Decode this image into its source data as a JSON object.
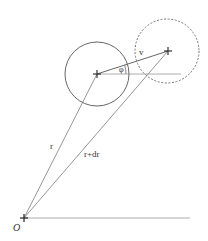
{
  "diagram": {
    "labels": {
      "origin": "O",
      "r": "r",
      "r_plus_dr": "r+dr",
      "v": "v",
      "phi": "φ"
    },
    "points": {
      "origin": {
        "x": 24,
        "y": 218
      },
      "center": {
        "x": 97,
        "y": 74
      },
      "moved": {
        "x": 168,
        "y": 51
      }
    },
    "circles": [
      {
        "name": "current-circle",
        "cx": 97,
        "cy": 74,
        "r": 32,
        "style": "solid"
      },
      {
        "name": "displaced-circle",
        "cx": 167,
        "cy": 51,
        "r": 32,
        "style": "dashed"
      }
    ],
    "colors": {
      "line": "#8a8a8a",
      "circle": "#666666",
      "text": "#333333"
    }
  }
}
